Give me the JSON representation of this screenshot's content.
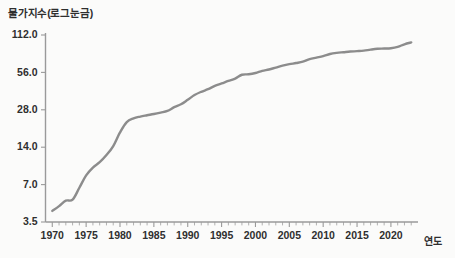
{
  "chart_data": {
    "type": "line",
    "title": "물가지수(로그눈금)",
    "xlabel": "연도",
    "ylabel": "",
    "yscale": "log",
    "grid": false,
    "legend": "none",
    "line_color": "#8c8c8c",
    "axis_color": "#9a9a9a",
    "xlim": [
      1969,
      2024
    ],
    "ylim": [
      3.5,
      112.0
    ],
    "ytick_labels": [
      "112.0",
      "56.0",
      "28.0",
      "14.0",
      "7.0",
      "3.5"
    ],
    "ytick_values": [
      112.0,
      56.0,
      28.0,
      14.0,
      7.0,
      3.5
    ],
    "xtick_labels": [
      "1970",
      "1975",
      "1980",
      "1985",
      "1990",
      "1995",
      "2000",
      "2005",
      "2010",
      "2015",
      "2020"
    ],
    "xtick_values": [
      1970,
      1975,
      1980,
      1985,
      1990,
      1995,
      2000,
      2005,
      2010,
      2015,
      2020
    ],
    "xminor_step": 1,
    "series": [
      {
        "name": "물가지수",
        "x": [
          1970,
          1971,
          1972,
          1973,
          1974,
          1975,
          1976,
          1977,
          1978,
          1979,
          1980,
          1981,
          1982,
          1983,
          1984,
          1985,
          1986,
          1987,
          1988,
          1989,
          1990,
          1991,
          1992,
          1993,
          1994,
          1995,
          1996,
          1997,
          1998,
          1999,
          2000,
          2001,
          2002,
          2003,
          2004,
          2005,
          2006,
          2007,
          2008,
          2009,
          2010,
          2011,
          2012,
          2013,
          2014,
          2015,
          2016,
          2017,
          2018,
          2019,
          2020,
          2021,
          2022,
          2023
        ],
        "values": [
          4.3,
          4.7,
          5.2,
          5.3,
          6.6,
          8.3,
          9.6,
          10.6,
          12.1,
          14.3,
          18.4,
          22.3,
          23.9,
          24.7,
          25.3,
          25.9,
          26.6,
          27.4,
          29.4,
          31.0,
          33.7,
          36.8,
          39.1,
          41.0,
          43.6,
          45.6,
          47.8,
          49.9,
          53.6,
          54.1,
          55.4,
          57.6,
          59.1,
          61.2,
          63.4,
          65.2,
          66.6,
          68.3,
          71.6,
          73.6,
          75.7,
          78.7,
          80.4,
          81.4,
          82.4,
          83.0,
          83.8,
          85.4,
          86.7,
          87.1,
          87.6,
          89.8,
          94.3,
          97.6
        ]
      }
    ],
    "annotations": []
  }
}
